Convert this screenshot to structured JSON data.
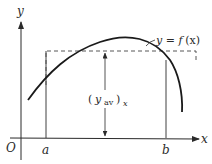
{
  "figure": {
    "colors": {
      "ink": "#2a2a2a",
      "background": "#ffffff"
    },
    "axes": {
      "x_label": "x",
      "y_label": "y",
      "origin_label": "O"
    },
    "interval": {
      "left_label": "a",
      "right_label": "b"
    },
    "curve": {
      "label_lhs": "y = ",
      "label_fn": "f",
      "label_arg": "(x)"
    },
    "average": {
      "open_paren": "(",
      "symbol": "y",
      "subscript": "av",
      "close_paren": ")",
      "outer_subscript": "x"
    }
  }
}
